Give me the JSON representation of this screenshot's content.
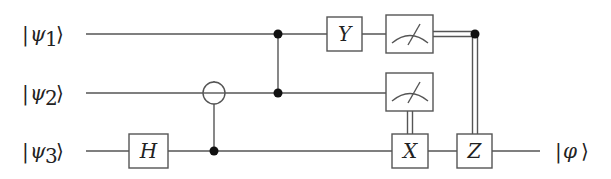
{
  "diagram": {
    "type": "quantum-circuit",
    "inputs": [
      {
        "label": "|ψ₁⟩",
        "ket": "ψ",
        "sub": "1"
      },
      {
        "label": "|ψ₂⟩",
        "ket": "ψ",
        "sub": "2"
      },
      {
        "label": "|ψ₃⟩",
        "ket": "ψ",
        "sub": "3"
      }
    ],
    "output": {
      "label": "|φ⟩",
      "ket": "φ",
      "qubit": 3
    },
    "gates": [
      {
        "name": "H",
        "label": "H",
        "qubit": 3
      },
      {
        "name": "CNOT",
        "control": 3,
        "target": 2
      },
      {
        "name": "CZ",
        "qubits": [
          1,
          2
        ]
      },
      {
        "name": "Y",
        "label": "Y",
        "qubit": 1
      },
      {
        "name": "Measure",
        "qubit": 1
      },
      {
        "name": "Measure",
        "qubit": 2
      },
      {
        "name": "X",
        "label": "X",
        "qubit": 3,
        "classically_controlled_by": 2
      },
      {
        "name": "Z",
        "label": "Z",
        "qubit": 3,
        "classically_controlled_by": 1
      }
    ],
    "colors": {
      "line": "#555555",
      "dot": "#111111",
      "background": "#ffffff"
    }
  }
}
